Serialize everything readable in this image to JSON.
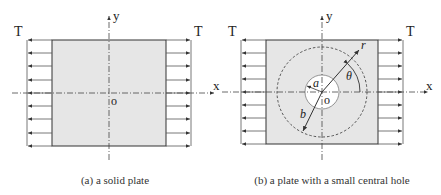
{
  "figures": [
    {
      "id": "a",
      "caption": "(a) a solid plate",
      "labels": {
        "load_left": "T",
        "load_right": "T",
        "x_axis": "x",
        "y_axis": "y",
        "origin": "o"
      }
    },
    {
      "id": "b",
      "caption": "(b) a plate with a small central hole",
      "labels": {
        "load_left": "T",
        "load_right": "T",
        "x_axis": "x",
        "y_axis": "y",
        "origin": "o",
        "hole_radius": "a",
        "outer_radius": "b",
        "radial_coord": "r",
        "angle": "θ"
      }
    }
  ],
  "colors": {
    "plate_fill": "#e6e6e6",
    "line": "#333333",
    "hole_fill": "#ffffff"
  }
}
